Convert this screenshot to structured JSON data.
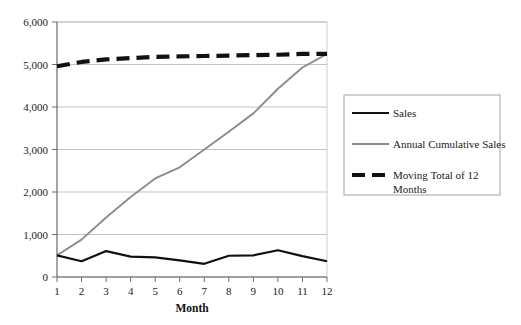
{
  "chart_data": {
    "type": "line",
    "title": "",
    "xlabel": "Month",
    "ylabel": "",
    "x": [
      1,
      2,
      3,
      4,
      5,
      6,
      7,
      8,
      9,
      10,
      11,
      12
    ],
    "categories": [
      "1",
      "2",
      "3",
      "4",
      "5",
      "6",
      "7",
      "8",
      "9",
      "10",
      "11",
      "12"
    ],
    "xlim": [
      1,
      12
    ],
    "ylim": [
      0,
      6000
    ],
    "ytick_labels": [
      "0",
      "1,000",
      "2,000",
      "3,000",
      "4,000",
      "5,000",
      "6,000"
    ],
    "ytick_values": [
      0,
      1000,
      2000,
      3000,
      4000,
      5000,
      6000
    ],
    "grid": true,
    "legend_position": "right",
    "series": [
      {
        "name": "Sales",
        "color": "#111111",
        "style": "solid",
        "width": 2.2,
        "values": [
          510,
          370,
          610,
          480,
          460,
          390,
          310,
          500,
          510,
          630,
          490,
          370
        ]
      },
      {
        "name": "Annual Cumulative Sales",
        "color": "#8c8c8c",
        "style": "solid",
        "width": 1.9,
        "values": [
          510,
          880,
          1400,
          1880,
          2320,
          2580,
          3000,
          3420,
          3850,
          4430,
          4930,
          5250
        ]
      },
      {
        "name": "Moving Total of 12 Months",
        "color": "#111111",
        "style": "dashed",
        "width": 4.2,
        "values": [
          4960,
          5060,
          5120,
          5150,
          5180,
          5190,
          5200,
          5210,
          5220,
          5230,
          5250,
          5250
        ]
      }
    ]
  },
  "legend": {
    "entries": [
      {
        "label": "Sales"
      },
      {
        "label": "Annual Cumulative Sales"
      },
      {
        "label": "Moving Total of 12",
        "label2": "Months"
      }
    ]
  },
  "axis": {
    "x_title": "Month"
  }
}
